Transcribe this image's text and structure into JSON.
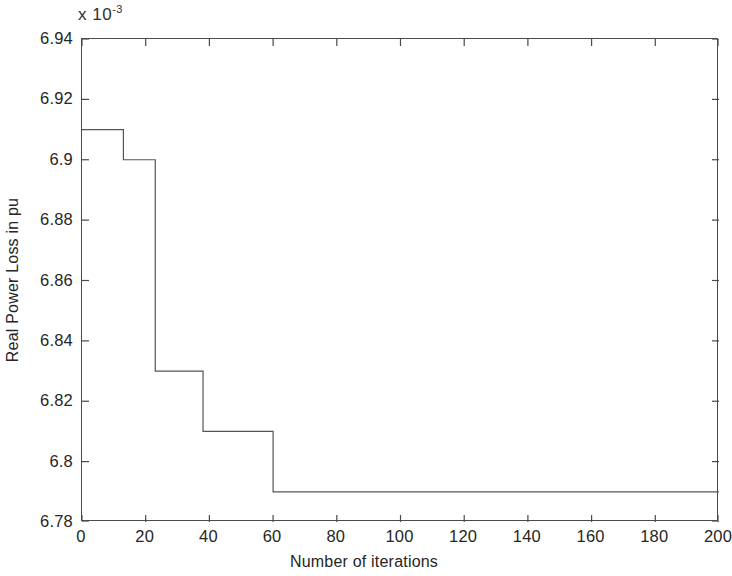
{
  "chart_data": {
    "type": "line",
    "subtype": "step",
    "title": "",
    "xlabel": "Number of iterations",
    "ylabel": "Real Power Loss in pu",
    "y_multiplier_text": "x 10",
    "y_multiplier_exponent": "-3",
    "y_multiplier_value": 0.001,
    "xlim": [
      0,
      200
    ],
    "ylim": [
      6.78,
      6.94
    ],
    "xticks": [
      0,
      20,
      40,
      60,
      80,
      100,
      120,
      140,
      160,
      180,
      200
    ],
    "xtick_labels": [
      "0",
      "20",
      "40",
      "60",
      "80",
      "100",
      "120",
      "140",
      "160",
      "180",
      "200"
    ],
    "yticks": [
      6.78,
      6.8,
      6.82,
      6.84,
      6.86,
      6.88,
      6.9,
      6.92,
      6.94
    ],
    "ytick_labels": [
      "6.78",
      "6.8",
      "6.82",
      "6.84",
      "6.86",
      "6.88",
      "6.9",
      "6.92",
      "6.94"
    ],
    "grid": false,
    "legend": false,
    "legend_position": "none",
    "line_color": "#555555",
    "line_width": 1.2,
    "series": [
      {
        "name": "Real power loss convergence",
        "x": [
          0,
          13,
          13,
          23,
          23,
          38,
          38,
          60,
          60,
          200
        ],
        "values": [
          6.91,
          6.91,
          6.9,
          6.9,
          6.83,
          6.83,
          6.81,
          6.81,
          6.79,
          6.79
        ],
        "steps": [
          {
            "x_start": 0,
            "x_end": 13,
            "y": 6.91
          },
          {
            "x_start": 13,
            "x_end": 23,
            "y": 6.9
          },
          {
            "x_start": 23,
            "x_end": 38,
            "y": 6.83
          },
          {
            "x_start": 38,
            "x_end": 60,
            "y": 6.81
          },
          {
            "x_start": 60,
            "x_end": 200,
            "y": 6.79
          }
        ]
      }
    ]
  },
  "figure": {
    "background_color": "#ffffff",
    "axis_color": "#4a4a4a"
  }
}
